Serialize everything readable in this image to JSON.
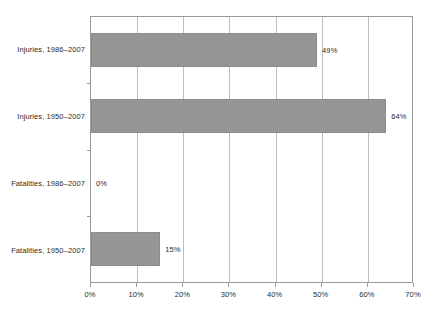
{
  "chart_data": {
    "type": "bar",
    "orientation": "horizontal",
    "title": "",
    "subtitle": "",
    "xlabel": "",
    "ylabel": "",
    "categories": [
      "Injuries, 1986–2007",
      "Injuries, 1950–2007",
      "Fatalities, 1986–2007",
      "Fatalities, 1950–2007"
    ],
    "values": [
      49,
      64,
      0,
      15
    ],
    "data_labels": [
      "49%",
      "64%",
      "0%",
      "15%"
    ],
    "xlim": [
      0,
      70
    ],
    "xticks": [
      0,
      10,
      20,
      30,
      40,
      50,
      60,
      70
    ],
    "xtick_labels": [
      "0%",
      "10%",
      "20%",
      "30%",
      "40%",
      "50%",
      "60%",
      "70%"
    ],
    "grid": {
      "vertical": true,
      "horizontal": false
    },
    "legend": {
      "visible": false,
      "position": "none",
      "entries": []
    },
    "series": [
      {
        "name": "",
        "values": [
          49,
          64,
          0,
          15
        ]
      }
    ],
    "colors": {
      "bar_fill": "#969696",
      "bar_border": "#8c8c8c",
      "gridline": "#bdbdbd",
      "axis": "#9a9a9a",
      "text": "#2b2b2b",
      "background": "#ffffff"
    }
  }
}
